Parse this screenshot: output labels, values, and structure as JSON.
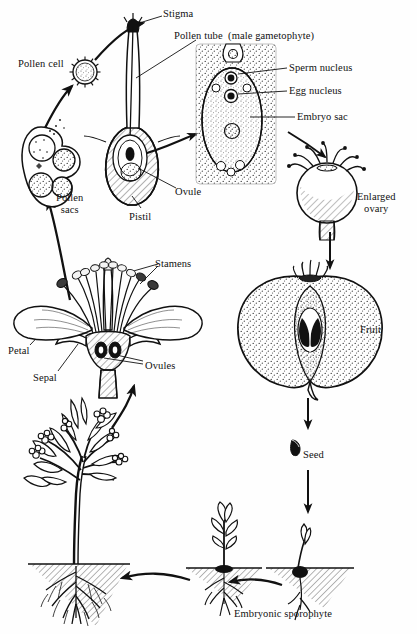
{
  "diagram": {
    "background_color": "#fefefe",
    "ink_color": "#111111",
    "width": 417,
    "height": 634
  },
  "labels": [
    {
      "id": "stigma",
      "text": "Stigma",
      "x": 163,
      "y": 8,
      "align": "left"
    },
    {
      "id": "pollen_tube",
      "text": "Pollen tube  (male gametophyte)",
      "x": 174,
      "y": 30,
      "align": "left"
    },
    {
      "id": "pollen_cell",
      "text": "Pollen cell",
      "x": 18,
      "y": 58,
      "align": "left"
    },
    {
      "id": "sperm_nucleus",
      "text": "Sperm nucleus",
      "x": 289,
      "y": 62,
      "align": "left"
    },
    {
      "id": "egg_nucleus",
      "text": "Egg nucleus",
      "x": 289,
      "y": 85,
      "align": "left"
    },
    {
      "id": "embryo_sac",
      "text": "Embryo sac",
      "x": 297,
      "y": 111,
      "align": "left"
    },
    {
      "id": "ovule",
      "text": "Ovule",
      "x": 175,
      "y": 186,
      "align": "left"
    },
    {
      "id": "enlarged_ovary",
      "text": "Enlarged\novary",
      "x": 357,
      "y": 191,
      "align": "center"
    },
    {
      "id": "pollen_sacs",
      "text": "Pollen\nsacs",
      "x": 56,
      "y": 192,
      "align": "center"
    },
    {
      "id": "pistil",
      "text": "Pistil",
      "x": 129,
      "y": 211,
      "align": "left"
    },
    {
      "id": "stamens",
      "text": "Stamens",
      "x": 155,
      "y": 258,
      "align": "left"
    },
    {
      "id": "fruit",
      "text": "Fruit",
      "x": 360,
      "y": 324,
      "align": "left"
    },
    {
      "id": "petal",
      "text": "Petal",
      "x": 8,
      "y": 345,
      "align": "left"
    },
    {
      "id": "ovules",
      "text": "Ovules",
      "x": 145,
      "y": 360,
      "align": "left"
    },
    {
      "id": "sepal",
      "text": "Sepal",
      "x": 33,
      "y": 372,
      "align": "left"
    },
    {
      "id": "seed",
      "text": "Seed",
      "x": 303,
      "y": 449,
      "align": "left"
    },
    {
      "id": "embryonic_sporophyte",
      "text": "Embryonic sporophyte",
      "x": 283,
      "y": 608,
      "align": "center"
    }
  ],
  "stages": [
    {
      "id": "pollen-cell",
      "name": "Pollen cell"
    },
    {
      "id": "pollen-sacs",
      "name": "Pollen sacs"
    },
    {
      "id": "pistil",
      "name": "Pistil with pollen tube"
    },
    {
      "id": "embryo-sac",
      "name": "Embryo sac / ovule"
    },
    {
      "id": "enlarged-ovary",
      "name": "Enlarged ovary"
    },
    {
      "id": "fruit",
      "name": "Fruit cross section"
    },
    {
      "id": "seed",
      "name": "Seed"
    },
    {
      "id": "seedling-young",
      "name": "Germinating seedling"
    },
    {
      "id": "seedling-older",
      "name": "Embryonic sporophyte"
    },
    {
      "id": "mature-plant",
      "name": "Mature flowering plant"
    },
    {
      "id": "flower",
      "name": "Flower longitudinal section"
    }
  ]
}
